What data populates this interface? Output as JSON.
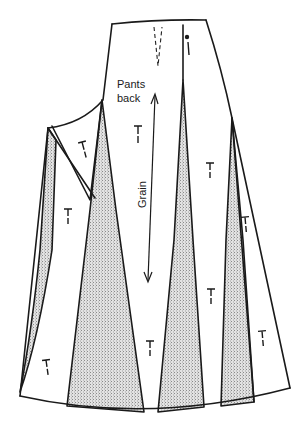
{
  "diagram": {
    "piece_label_line1": "Pants",
    "piece_label_line2": "back",
    "grain_label": "Grain",
    "grainline_marker_symbol": "T",
    "colors": {
      "line": "#1a1a1a",
      "background": "#ffffff",
      "slash_fill": "#d4d4d4"
    },
    "slash_count": 4,
    "grainline_marker_count": 11
  }
}
